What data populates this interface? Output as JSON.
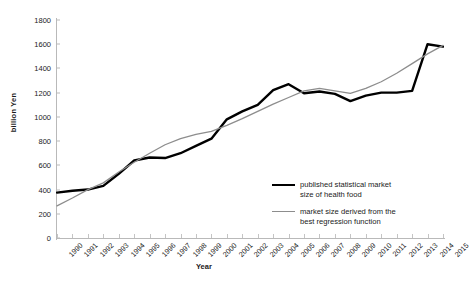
{
  "chart_data": {
    "type": "line",
    "title": "",
    "xlabel": "Year",
    "ylabel": "billion Yen",
    "xlim": [
      1990,
      2015
    ],
    "ylim": [
      0,
      1800
    ],
    "ytick_step": 200,
    "grid": false,
    "legend_position": "inside-bottom-right",
    "categories": [
      "1990",
      "1991",
      "1992",
      "1993",
      "1994",
      "1995",
      "1996",
      "1997",
      "1998",
      "1999",
      "2000",
      "2001",
      "2002",
      "2003",
      "2004",
      "2005",
      "2006",
      "2007",
      "2008",
      "2009",
      "2010",
      "2011",
      "2012",
      "2013",
      "2014",
      "2015"
    ],
    "yticks": [
      "0",
      "200",
      "400",
      "600",
      "800",
      "1000",
      "1200",
      "1400",
      "1600",
      "1800"
    ],
    "series": [
      {
        "name": "published statistical market size of health food",
        "color": "#000000",
        "width": 2.4,
        "values": [
          375,
          390,
          400,
          430,
          530,
          640,
          665,
          660,
          700,
          760,
          820,
          980,
          1045,
          1100,
          1220,
          1270,
          1195,
          1210,
          1190,
          1130,
          1175,
          1200,
          1200,
          1215,
          1600,
          1580
        ]
      },
      {
        "name": "market size derived from the best regression function",
        "color": "#8d8d8d",
        "width": 1.3,
        "values": [
          265,
          330,
          400,
          455,
          545,
          625,
          700,
          770,
          820,
          855,
          880,
          930,
          985,
          1045,
          1105,
          1160,
          1215,
          1235,
          1215,
          1195,
          1235,
          1290,
          1360,
          1440,
          1520,
          1590
        ]
      }
    ]
  },
  "legend": {
    "items": [
      {
        "line1": "published statistical market",
        "line2": "size of health food"
      },
      {
        "line1": "market size derived from the",
        "line2": "best regression function"
      }
    ]
  }
}
